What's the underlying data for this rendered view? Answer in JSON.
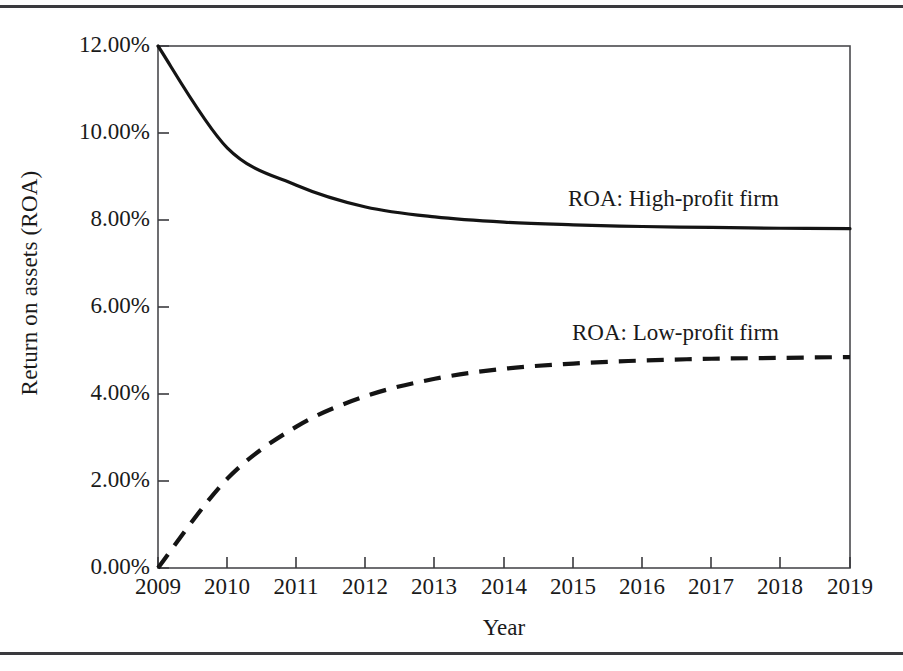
{
  "figure": {
    "has_top_rule": true,
    "has_bottom_rule": true,
    "rule_color": "#3a3a3e",
    "background": "#ffffff"
  },
  "chart_data": {
    "type": "line",
    "title": "",
    "xlabel": "Year",
    "ylabel": "Return on assets (ROA)",
    "x": [
      2009,
      2010,
      2011,
      2012,
      2013,
      2014,
      2015,
      2016,
      2017,
      2018,
      2019
    ],
    "categories": [
      "2009",
      "2010",
      "2011",
      "2012",
      "2013",
      "2014",
      "2015",
      "2016",
      "2017",
      "2018",
      "2019"
    ],
    "xlim": [
      2009,
      2019
    ],
    "ylim": [
      0,
      12
    ],
    "ytick_values": [
      0,
      2,
      4,
      6,
      8,
      10,
      12
    ],
    "ytick_labels": [
      "0.00%",
      "2.00%",
      "4.00%",
      "6.00%",
      "8.00%",
      "10.00%",
      "12.00%"
    ],
    "grid": false,
    "legend": "inline-annotations",
    "line_color": "#141414",
    "series": [
      {
        "name": "ROA: High-profit firm",
        "style": "solid",
        "annotation": "ROA: High-profit firm",
        "values": [
          12.0,
          9.66,
          8.8,
          8.3,
          8.07,
          7.95,
          7.89,
          7.85,
          7.83,
          7.81,
          7.8
        ]
      },
      {
        "name": "ROA: Low-profit firm",
        "style": "dashed",
        "annotation": "ROA: Low-profit firm",
        "values": [
          0.0,
          2.05,
          3.25,
          3.95,
          4.35,
          4.58,
          4.7,
          4.77,
          4.81,
          4.83,
          4.85
        ]
      }
    ]
  }
}
